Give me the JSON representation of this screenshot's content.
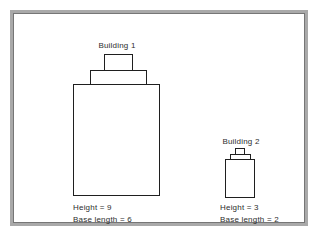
{
  "diagram": {
    "colors": {
      "background": "#ffffff",
      "frame_border": "#a9a9a9",
      "frame_inner_edge": "#767676",
      "building_stroke": "#1f1f1f",
      "text": "#2d2d2d"
    }
  },
  "buildings": {
    "b1": {
      "label": "Building 1",
      "height_text": "Height = 9",
      "base_text": "Base length = 6",
      "height": 9,
      "base_length": 6
    },
    "b2": {
      "label": "Building 2",
      "height_text": "Height = 3",
      "base_text": "Base length = 2",
      "height": 3,
      "base_length": 2
    }
  }
}
